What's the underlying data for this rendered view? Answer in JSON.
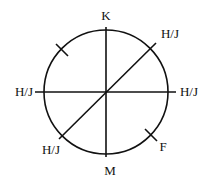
{
  "diagram": {
    "stroke_color": "#111111",
    "background": "#ffffff",
    "circle": {
      "cx": 106,
      "cy": 92,
      "r": 62
    },
    "lines": {
      "vertical": {
        "x1": 106,
        "y1": 27,
        "x2": 106,
        "y2": 157
      },
      "horizontal": {
        "x1": 35,
        "y1": 92,
        "x2": 176,
        "y2": 92
      },
      "diagonal": {
        "x1": 59,
        "y1": 139,
        "x2": 156,
        "y2": 43
      }
    },
    "ticks": [
      {
        "name": "upper-left-tick",
        "x1": 56,
        "y1": 44,
        "x2": 68,
        "y2": 56
      },
      {
        "name": "lower-right-tick",
        "x1": 145,
        "y1": 129,
        "x2": 157,
        "y2": 141
      }
    ],
    "labels": {
      "top": {
        "text": "K",
        "x": 106,
        "y": 20
      },
      "upper_right": {
        "text": "H/J",
        "x": 170,
        "y": 38
      },
      "right": {
        "text": "H/J",
        "x": 189,
        "y": 96
      },
      "left": {
        "text": "H/J",
        "x": 24,
        "y": 96
      },
      "lower_left": {
        "text": "H/J",
        "x": 51,
        "y": 154
      },
      "lower_right": {
        "text": "F",
        "x": 163,
        "y": 151
      },
      "bottom": {
        "text": "M",
        "x": 110,
        "y": 175
      }
    }
  }
}
